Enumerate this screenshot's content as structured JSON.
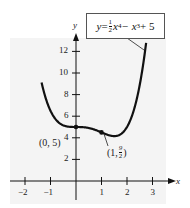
{
  "chart_data": {
    "type": "line",
    "title": "",
    "equation": "y = ½x⁴ − x³ + 5",
    "xlabel": "x",
    "ylabel": "y",
    "xlim": [
      -2.5,
      3.3
    ],
    "ylim": [
      -1.5,
      14
    ],
    "x_ticks": [
      -2,
      -1,
      1,
      2,
      3
    ],
    "x_tick_labels": [
      "−2",
      "−1",
      "1",
      "2",
      "3"
    ],
    "y_ticks": [
      2,
      4,
      6,
      8,
      10,
      12
    ],
    "y_tick_labels": [
      "2",
      "4",
      "6",
      "8",
      "10",
      "12"
    ],
    "grid": false,
    "series": [
      {
        "name": "y = 1/2 x^4 - x^3 + 5",
        "function": "0.5*x^4 - x^3 + 5",
        "x_range": [
          -1.35,
          2.75
        ]
      }
    ],
    "points": [
      {
        "x": 0,
        "y": 5,
        "label": "(0, 5)"
      },
      {
        "x": 1,
        "y": 4.5,
        "label": "(1, 9/2)"
      }
    ]
  },
  "labels": {
    "eq_y": "y",
    "eq_eq": " = ",
    "eq_num": "1",
    "eq_den": "2",
    "eq_rest1": "x",
    "eq_exp1": "4",
    "eq_minus": " − x",
    "eq_exp2": "3",
    "eq_plus": " + 5",
    "axis_x": "x",
    "axis_y": "y",
    "pt1": "(0, 5)",
    "pt2_a": "(1, ",
    "pt2_num": "9",
    "pt2_den": "2",
    "pt2_b": ")"
  }
}
